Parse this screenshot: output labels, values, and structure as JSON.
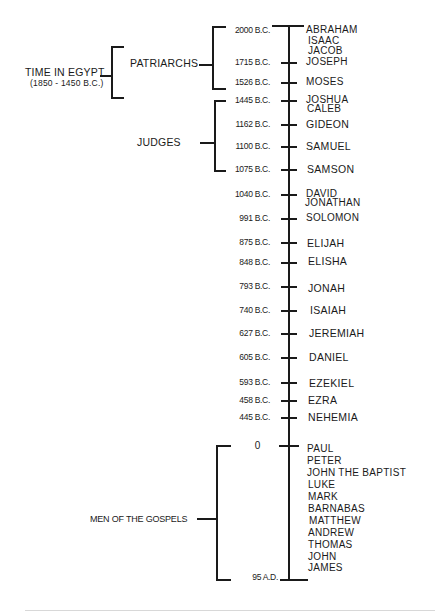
{
  "diagram": {
    "type": "timeline",
    "groups": {
      "egypt": {
        "label": "TIME IN EGYPT",
        "sublabel": "(1850 - 1450 B.C.)"
      },
      "patriarchs": {
        "label": "PATRIARCHS"
      },
      "judges": {
        "label": "JUDGES"
      },
      "gospels": {
        "label": "MEN OF THE GOSPELS"
      }
    },
    "entries": [
      {
        "date": "2000 B.C.",
        "names": [
          "ABRAHAM",
          "ISAAC",
          "JACOB"
        ]
      },
      {
        "date": "1715 B.C.",
        "names": [
          "JOSEPH"
        ]
      },
      {
        "date": "1526 B.C.",
        "names": [
          "MOSES"
        ]
      },
      {
        "date": "1445 B.C.",
        "names": [
          "JOSHUA",
          "CALEB"
        ]
      },
      {
        "date": "1162 B.C.",
        "names": [
          "GIDEON"
        ]
      },
      {
        "date": "1100 B.C.",
        "names": [
          "SAMUEL"
        ]
      },
      {
        "date": "1075 B.C.",
        "names": [
          "SAMSON"
        ]
      },
      {
        "date": "1040 B.C.",
        "names": [
          "DAVID",
          "JONATHAN"
        ]
      },
      {
        "date": "991 B.C.",
        "names": [
          "SOLOMON"
        ]
      },
      {
        "date": "875 B.C.",
        "names": [
          "ELIJAH"
        ]
      },
      {
        "date": "848 B.C.",
        "names": [
          "ELISHA"
        ]
      },
      {
        "date": "793 B.C.",
        "names": [
          "JONAH"
        ]
      },
      {
        "date": "740 B.C.",
        "names": [
          "ISAIAH"
        ]
      },
      {
        "date": "627 B.C.",
        "names": [
          "JEREMIAH"
        ]
      },
      {
        "date": "605 B.C.",
        "names": [
          "DANIEL"
        ]
      },
      {
        "date": "593 B.C.",
        "names": [
          "EZEKIEL"
        ]
      },
      {
        "date": "458 B.C.",
        "names": [
          "EZRA"
        ]
      },
      {
        "date": "445 B.C.",
        "names": [
          "NEHEMIA"
        ]
      },
      {
        "date": "0",
        "names": [
          "PAUL",
          "PETER",
          "JOHN THE BAPTIST",
          "LUKE",
          "MARK",
          "BARNABAS",
          "MATTHEW",
          "ANDREW",
          "THOMAS",
          "JOHN",
          "JAMES"
        ]
      },
      {
        "date": "95 A.D.",
        "names": []
      }
    ]
  }
}
